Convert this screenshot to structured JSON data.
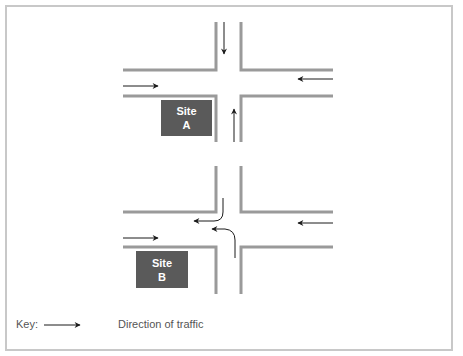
{
  "diagram": {
    "sites": [
      {
        "name": "Site A",
        "line1": "Site",
        "line2": "A"
      },
      {
        "name": "Site B",
        "line1": "Site",
        "line2": "B"
      }
    ],
    "intersections": [
      "upper-crossroads",
      "lower-crossroads"
    ],
    "colors": {
      "road_edge": "#9a9a9a",
      "site_fill": "#5a5a5a",
      "arrow": "#1a1a1a",
      "frame": "#c8c8c8"
    }
  },
  "key": {
    "label": "Key:",
    "arrow_meaning": "Direction of traffic"
  }
}
